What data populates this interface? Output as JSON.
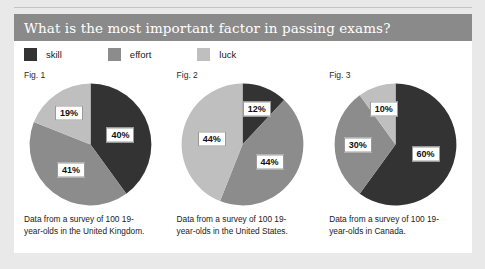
{
  "page": {
    "title": "What is the most important factor in passing exams?",
    "panel_bg": "#ffffff",
    "background": "#e9e9e9",
    "title_bar_color": "#8a8a8a"
  },
  "legend": {
    "items": [
      {
        "label": "skill",
        "color": "#333333",
        "name": "legend-item-skill"
      },
      {
        "label": "effort",
        "color": "#8c8c8c",
        "name": "legend-item-effort"
      },
      {
        "label": "luck",
        "color": "#bfbfbf",
        "name": "legend-item-luck"
      }
    ]
  },
  "chart_data": [
    {
      "type": "pie",
      "title": "Fig. 1",
      "caption": "Data from a survey of 100 19-year-olds in the United Kingdom.",
      "categories": [
        "skill",
        "effort",
        "luck"
      ],
      "values": [
        40,
        41,
        19
      ],
      "labels": [
        "40%",
        "41%",
        "19%"
      ],
      "colors": [
        "#333333",
        "#8c8c8c",
        "#bfbfbf"
      ],
      "start_angle": 0,
      "direction": "clockwise",
      "legend_position": "top"
    },
    {
      "type": "pie",
      "title": "Fig. 2",
      "caption": "Data from a survey of 100 19-year-olds in the United States.",
      "categories": [
        "skill",
        "effort",
        "luck"
      ],
      "values": [
        12,
        44,
        44
      ],
      "labels": [
        "12%",
        "44%",
        "44%"
      ],
      "colors": [
        "#333333",
        "#8c8c8c",
        "#bfbfbf"
      ],
      "start_angle": 0,
      "direction": "clockwise",
      "legend_position": "top"
    },
    {
      "type": "pie",
      "title": "Fig. 3",
      "caption": "Data from a survey of 100 19-year-olds in Canada.",
      "categories": [
        "skill",
        "effort",
        "luck"
      ],
      "values": [
        60,
        30,
        10
      ],
      "labels": [
        "60%",
        "30%",
        "10%"
      ],
      "colors": [
        "#333333",
        "#8c8c8c",
        "#bfbfbf"
      ],
      "start_angle": 0,
      "direction": "clockwise",
      "legend_position": "top"
    }
  ]
}
